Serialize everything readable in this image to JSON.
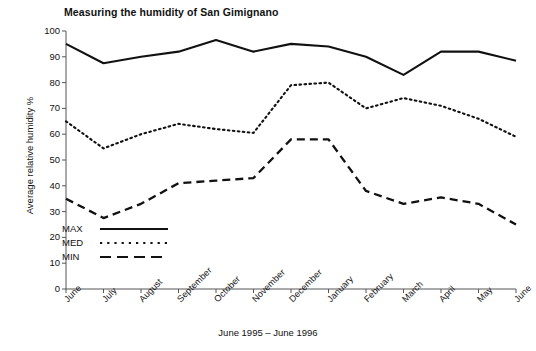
{
  "chart_data": {
    "type": "line",
    "title": "Measuring the humidity of San Gimignano",
    "xlabel": "June 1995 – June 1996",
    "ylabel": "Average relative humidity %",
    "ylim": [
      0,
      100
    ],
    "ytick_step": 10,
    "grid": false,
    "legend_position": "inside-bottom-left",
    "categories": [
      "June",
      "July",
      "August",
      "September",
      "October",
      "November",
      "December",
      "January",
      "February",
      "March",
      "April",
      "May",
      "June"
    ],
    "yticks": [
      "0",
      "10",
      "20",
      "30",
      "40",
      "50",
      "60",
      "70",
      "80",
      "90",
      "100"
    ],
    "series": [
      {
        "name": "MAX",
        "style": "solid",
        "color": "#111111",
        "values": [
          95,
          87.5,
          90,
          92,
          96.5,
          92,
          95,
          94,
          90,
          83,
          92,
          92,
          88.5
        ]
      },
      {
        "name": "MED",
        "style": "dotted",
        "color": "#111111",
        "values": [
          65,
          54.5,
          60,
          64,
          62,
          60.5,
          79,
          80,
          70,
          74,
          71,
          66,
          59
        ]
      },
      {
        "name": "MIN",
        "style": "dashed",
        "color": "#111111",
        "values": [
          35,
          27.5,
          33,
          41,
          42,
          43,
          58,
          58,
          38,
          33,
          35.5,
          33,
          25
        ]
      }
    ]
  },
  "legend": {
    "entries": [
      {
        "label": "MAX"
      },
      {
        "label": "MED"
      },
      {
        "label": "MIN"
      }
    ]
  }
}
